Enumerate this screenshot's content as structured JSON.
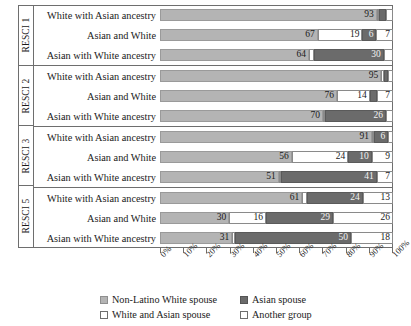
{
  "chart_data": {
    "type": "bar",
    "subtype": "stacked-horizontal-100-percent",
    "title": "",
    "xlabel": "",
    "ylabel": "",
    "xlim": [
      0,
      100
    ],
    "xticks": [
      "0%",
      "10%",
      "20%",
      "30%",
      "40%",
      "50%",
      "60%",
      "70%",
      "80%",
      "90%",
      "100%"
    ],
    "grid": false,
    "legend_position": "bottom",
    "series": [
      {
        "name": "Non-Latino White spouse",
        "color": "#b4b4b4"
      },
      {
        "name": "White and Asian spouse",
        "color": "#ffffff"
      },
      {
        "name": "Asian spouse",
        "color": "#6b6b6b"
      },
      {
        "name": "Another group",
        "color": "#ffffff"
      }
    ],
    "groups": [
      {
        "name": "RESCI 1",
        "rows": [
          {
            "category": "White with Asian ancestry",
            "segments": [
              {
                "series": "Non-Latino White spouse",
                "value": 93,
                "label": "93"
              },
              {
                "series": "White and Asian spouse",
                "value": 1,
                "label": ""
              },
              {
                "series": "Asian spouse",
                "value": 3,
                "label": ""
              },
              {
                "series": "Another group",
                "value": 3,
                "label": ""
              }
            ]
          },
          {
            "category": "Asian and White",
            "segments": [
              {
                "series": "Non-Latino White spouse",
                "value": 67,
                "label": "67"
              },
              {
                "series": "White and Asian spouse",
                "value": 19,
                "label": "19"
              },
              {
                "series": "Asian spouse",
                "value": 6,
                "label": "6"
              },
              {
                "series": "Another group",
                "value": 7,
                "label": "7"
              }
            ]
          },
          {
            "category": "Asian with White ancestry",
            "segments": [
              {
                "series": "Non-Latino White spouse",
                "value": 64,
                "label": "64"
              },
              {
                "series": "White and Asian spouse",
                "value": 2,
                "label": ""
              },
              {
                "series": "Asian spouse",
                "value": 30,
                "label": "30"
              },
              {
                "series": "Another group",
                "value": 4,
                "label": ""
              }
            ]
          }
        ]
      },
      {
        "name": "RESCI 2",
        "rows": [
          {
            "category": "White with Asian ancestry",
            "segments": [
              {
                "series": "Non-Latino White spouse",
                "value": 95,
                "label": "95"
              },
              {
                "series": "White and Asian spouse",
                "value": 1,
                "label": ""
              },
              {
                "series": "Asian spouse",
                "value": 2,
                "label": ""
              },
              {
                "series": "Another group",
                "value": 2,
                "label": ""
              }
            ]
          },
          {
            "category": "Asian and White",
            "segments": [
              {
                "series": "Non-Latino White spouse",
                "value": 76,
                "label": "76"
              },
              {
                "series": "White and Asian spouse",
                "value": 14,
                "label": "14"
              },
              {
                "series": "Asian spouse",
                "value": 3,
                "label": ""
              },
              {
                "series": "Another group",
                "value": 7,
                "label": "7"
              }
            ]
          },
          {
            "category": "Asian with White ancestry",
            "segments": [
              {
                "series": "Non-Latino White spouse",
                "value": 70,
                "label": "70"
              },
              {
                "series": "White and Asian spouse",
                "value": 1,
                "label": ""
              },
              {
                "series": "Asian spouse",
                "value": 26,
                "label": "26"
              },
              {
                "series": "Another group",
                "value": 3,
                "label": ""
              }
            ]
          }
        ]
      },
      {
        "name": "RESCI 3",
        "rows": [
          {
            "category": "White with Asian ancestry",
            "segments": [
              {
                "series": "Non-Latino White spouse",
                "value": 91,
                "label": "91"
              },
              {
                "series": "White and Asian spouse",
                "value": 1,
                "label": ""
              },
              {
                "series": "Asian spouse",
                "value": 6,
                "label": "6"
              },
              {
                "series": "Another group",
                "value": 2,
                "label": ""
              }
            ]
          },
          {
            "category": "Asian and White",
            "segments": [
              {
                "series": "Non-Latino White spouse",
                "value": 56,
                "label": "56"
              },
              {
                "series": "White and Asian spouse",
                "value": 24,
                "label": "24"
              },
              {
                "series": "Asian spouse",
                "value": 10,
                "label": "10"
              },
              {
                "series": "Another group",
                "value": 9,
                "label": "9"
              }
            ]
          },
          {
            "category": "Asian with White ancestry",
            "segments": [
              {
                "series": "Non-Latino White spouse",
                "value": 51,
                "label": "51"
              },
              {
                "series": "White and Asian spouse",
                "value": 1,
                "label": ""
              },
              {
                "series": "Asian spouse",
                "value": 41,
                "label": "41"
              },
              {
                "series": "Another group",
                "value": 7,
                "label": "7"
              }
            ]
          }
        ]
      },
      {
        "name": "RESCI 5",
        "rows": [
          {
            "category": "White with Asian ancestry",
            "segments": [
              {
                "series": "Non-Latino White spouse",
                "value": 61,
                "label": "61"
              },
              {
                "series": "White and Asian spouse",
                "value": 2,
                "label": ""
              },
              {
                "series": "Asian spouse",
                "value": 24,
                "label": "24"
              },
              {
                "series": "Another group",
                "value": 13,
                "label": "13"
              }
            ]
          },
          {
            "category": "Asian and White",
            "segments": [
              {
                "series": "Non-Latino White spouse",
                "value": 30,
                "label": "30"
              },
              {
                "series": "White and Asian spouse",
                "value": 16,
                "label": "16"
              },
              {
                "series": "Asian spouse",
                "value": 29,
                "label": "29"
              },
              {
                "series": "Another group",
                "value": 26,
                "label": "26"
              }
            ]
          },
          {
            "category": "Asian with White ancestry",
            "segments": [
              {
                "series": "Non-Latino White spouse",
                "value": 31,
                "label": "31"
              },
              {
                "series": "White and Asian spouse",
                "value": 1,
                "label": ""
              },
              {
                "series": "Asian spouse",
                "value": 50,
                "label": "50"
              },
              {
                "series": "Another group",
                "value": 18,
                "label": "18"
              }
            ]
          }
        ]
      }
    ]
  }
}
